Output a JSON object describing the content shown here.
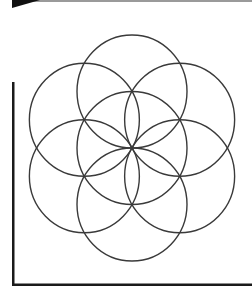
{
  "diagram": {
    "colors": {
      "background": "#ffffff",
      "stroke": "#3a3a3a",
      "frame": "#1a1a1a",
      "top_bar": "#9a9a9a",
      "wedge": "#111111"
    },
    "center": {
      "x": 132,
      "y": 148
    },
    "radius_x": 55,
    "radius_y": 56.5,
    "circles": [
      {
        "name": "center",
        "dx": 0,
        "dy": 0
      },
      {
        "name": "top",
        "dx": 0,
        "dy": -1
      },
      {
        "name": "bottom",
        "dx": 0,
        "dy": 1
      },
      {
        "name": "upper-left",
        "dx": -0.866,
        "dy": -0.5
      },
      {
        "name": "upper-right",
        "dx": 0.866,
        "dy": -0.5
      },
      {
        "name": "lower-left",
        "dx": -0.866,
        "dy": 0.5
      },
      {
        "name": "lower-right",
        "dx": 0.866,
        "dy": 0.5
      }
    ]
  }
}
